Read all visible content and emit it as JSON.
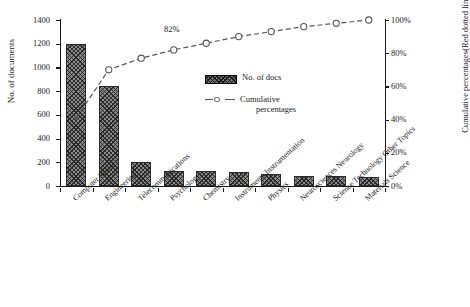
{
  "chart_data": {
    "type": "bar",
    "title": "",
    "subtitle": "",
    "xlabel": "",
    "ylabel": "No. of documents",
    "y2label": "Cumulative percentages(Red dotted line)",
    "grid": false,
    "legend_position": "inside-right-upper",
    "ylim": [
      0,
      1400
    ],
    "y2lim": [
      0,
      100
    ],
    "yticks": [
      "0",
      "200",
      "400",
      "600",
      "800",
      "1000",
      "1200",
      "1400"
    ],
    "ytick_values": [
      0,
      200,
      400,
      600,
      800,
      1000,
      1200,
      1400
    ],
    "y2ticks": [
      "0%",
      "20%",
      "40%",
      "60%",
      "80%",
      "100%"
    ],
    "y2tick_values": [
      0,
      20,
      40,
      60,
      80,
      100
    ],
    "categories": [
      "Computer Science",
      "Engineering",
      "Telecommunications",
      "Psychology",
      "Chemistry",
      "Instruments Instrumentation",
      "Physics",
      "Neurosciences Neurology",
      "Science Technology Other Topics",
      "Materials Science"
    ],
    "series": [
      {
        "name": "No. of docs",
        "type": "bar",
        "axis": "left",
        "values": [
          1195,
          845,
          200,
          130,
          128,
          115,
          100,
          85,
          83,
          75
        ]
      },
      {
        "name": "Cumulative percentages",
        "type": "line",
        "axis": "right",
        "values": [
          41,
          70,
          77,
          82,
          86,
          90,
          93,
          96,
          98,
          100
        ]
      }
    ],
    "annotations": [
      {
        "text": "82%",
        "series": "Cumulative percentages",
        "at_category": "Psychology",
        "value": 82
      }
    ]
  },
  "legend": {
    "items": [
      {
        "label": "No. of docs",
        "marker": "hatched-bar-swatch"
      },
      {
        "label": "Cumulative",
        "label2": "percentages",
        "marker": "dashed-line-circle-marker"
      }
    ]
  },
  "colors": {
    "axis": "#1a1a1a",
    "bar_fill": "#8a8a8a",
    "bar_hatch": "#1e1e1e",
    "line": "#555555",
    "marker_face": "#ffffff",
    "background": "#ffffff"
  }
}
